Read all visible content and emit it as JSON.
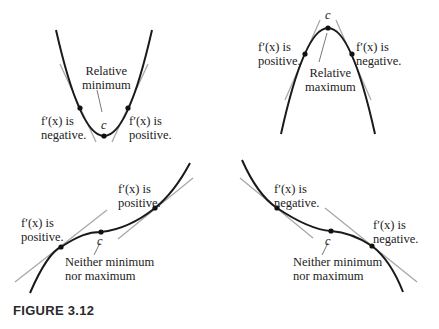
{
  "figure": {
    "caption": "FIGURE 3.12"
  },
  "panels": [
    {
      "id": "relative-minimum",
      "center_label": "Relative minimum",
      "center_label_lines": [
        "Relative",
        "minimum"
      ],
      "point_label": "c",
      "left_label": [
        "f′(x) is",
        "negative."
      ],
      "right_label": [
        "f′(x) is",
        "positive."
      ]
    },
    {
      "id": "relative-maximum",
      "center_label_lines": [
        "Relative",
        "maximum"
      ],
      "point_label": "c",
      "left_label": [
        "f′(x) is",
        "positive."
      ],
      "right_label": [
        "f′(x) is",
        "negative."
      ]
    },
    {
      "id": "increasing-inflection",
      "center_label_lines": [
        "Neither minimum",
        "nor maximum"
      ],
      "point_label": "c",
      "left_label": [
        "f′(x) is",
        "positive."
      ],
      "right_label": [
        "f′(x) is",
        "positive."
      ]
    },
    {
      "id": "decreasing-inflection",
      "center_label_lines": [
        "Neither minimum",
        "nor maximum"
      ],
      "point_label": "c",
      "left_label": [
        "f′(x) is",
        "negative."
      ],
      "right_label": [
        "f′(x) is",
        "negative."
      ]
    }
  ],
  "colors": {
    "curve": "#1a1a1a",
    "tangent": "#a8a8a8",
    "text": "#222222"
  }
}
